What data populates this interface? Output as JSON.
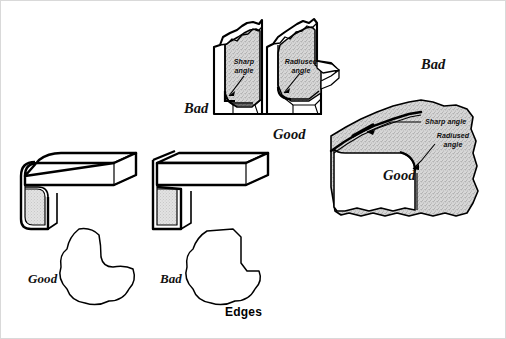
{
  "figure": {
    "caption": "Edges",
    "background_color": "#ffffff",
    "ink_color": "#000000",
    "stipple_color": "#c9c9c9"
  },
  "top_assembly": {
    "name": "die-blocks-pair",
    "bad_label": "Bad",
    "good_label": "Good",
    "left_block": {
      "annotation_line1": "Sharp",
      "annotation_line2": "angle"
    },
    "right_block": {
      "annotation_line1": "Radiused",
      "annotation_line2": "angle"
    }
  },
  "right_assembly": {
    "name": "forged-block",
    "bad_label": "Bad",
    "good_label": "Good",
    "sharp_annotation": "Sharp angle",
    "radiused_annotation_line1": "Radiused",
    "radiused_annotation_line2": "angle"
  },
  "bottom_left": {
    "name": "angle-bracket-rounded",
    "label": "Good"
  },
  "bottom_mid": {
    "name": "angle-bracket-sharp",
    "label": "Bad"
  }
}
